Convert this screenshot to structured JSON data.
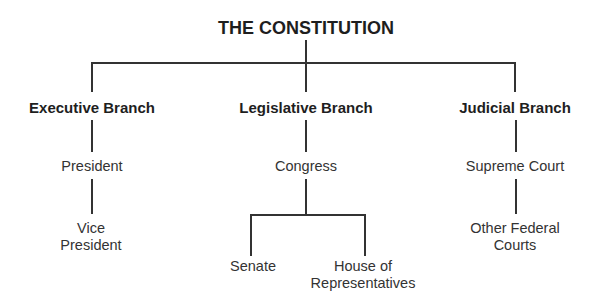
{
  "diagram": {
    "title": "THE CONSTITUTION",
    "branches": [
      {
        "name": "Executive Branch",
        "level1": "President",
        "level2_line1": "Vice",
        "level2_line2": "President"
      },
      {
        "name": "Legislative Branch",
        "level1": "Congress",
        "children": [
          {
            "line1": "Senate",
            "line2": ""
          },
          {
            "line1": "House of",
            "line2": "Representatives"
          }
        ]
      },
      {
        "name": "Judicial Branch",
        "level1": "Supreme Court",
        "level2_line1": "Other Federal",
        "level2_line2": "Courts"
      }
    ]
  }
}
